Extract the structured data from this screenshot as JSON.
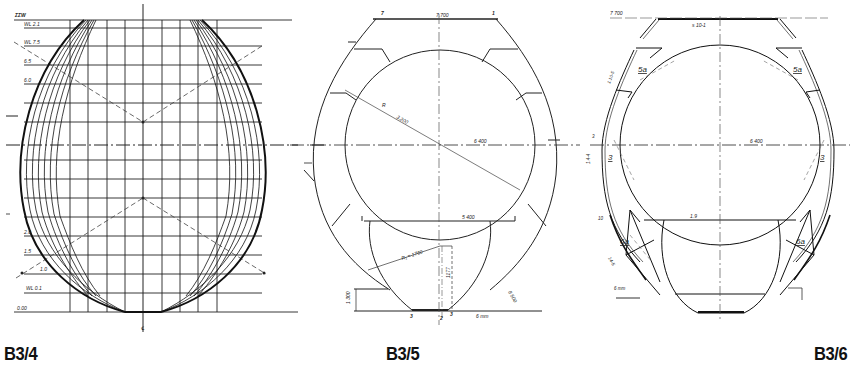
{
  "figures": [
    {
      "id": "B3/4",
      "caption": "B3/4",
      "type": "lines-plan-grid",
      "waterline_labels": [
        "ΣΣW",
        "WL 2.1",
        "WL 7.5",
        "6.5",
        "6.0",
        "2.0",
        "1.5",
        "1.0",
        "WL 0.1",
        "0.00"
      ],
      "centerline_label": "℄",
      "frame_labels_left": [
        "0.4",
        "0.2",
        "0.1",
        "0.0",
        "1.0",
        "2.1"
      ],
      "frame_labels_right": [
        "7.1",
        "7.4",
        "7.5",
        "8.1"
      ]
    },
    {
      "id": "B3/5",
      "caption": "B3/5",
      "type": "cross-section",
      "dimensions": {
        "top_width": "7.700",
        "radius_label": "R",
        "radius_value": "3.200",
        "upper_diameter": "6 400",
        "lower_width": "5 400",
        "lower_radius": "R₁ = 1760",
        "lower_height": "1177",
        "bottom_offset_left": "1 300",
        "bottom_offset_right": "8 500",
        "bottom_note": "6 mm"
      },
      "top_markers": [
        "7",
        "1"
      ],
      "bottom_markers": [
        "3",
        "2",
        "3"
      ]
    },
    {
      "id": "B3/6",
      "caption": "B3/6",
      "type": "structural-section",
      "dimensions": {
        "top_label": "7 700",
        "top_plate": "s 10-1",
        "diameter": "6 400",
        "mid_label": "1.9"
      },
      "member_labels": [
        "5a",
        "5a",
        "3",
        "3",
        "6a",
        "6a"
      ],
      "side_labels": [
        "3",
        "1.4-4",
        "1.10-5",
        "10",
        "14-5",
        "6 mm"
      ]
    }
  ],
  "colors": {
    "ink": "#1a1a1a",
    "background": "#ffffff",
    "grid": "#333333"
  }
}
